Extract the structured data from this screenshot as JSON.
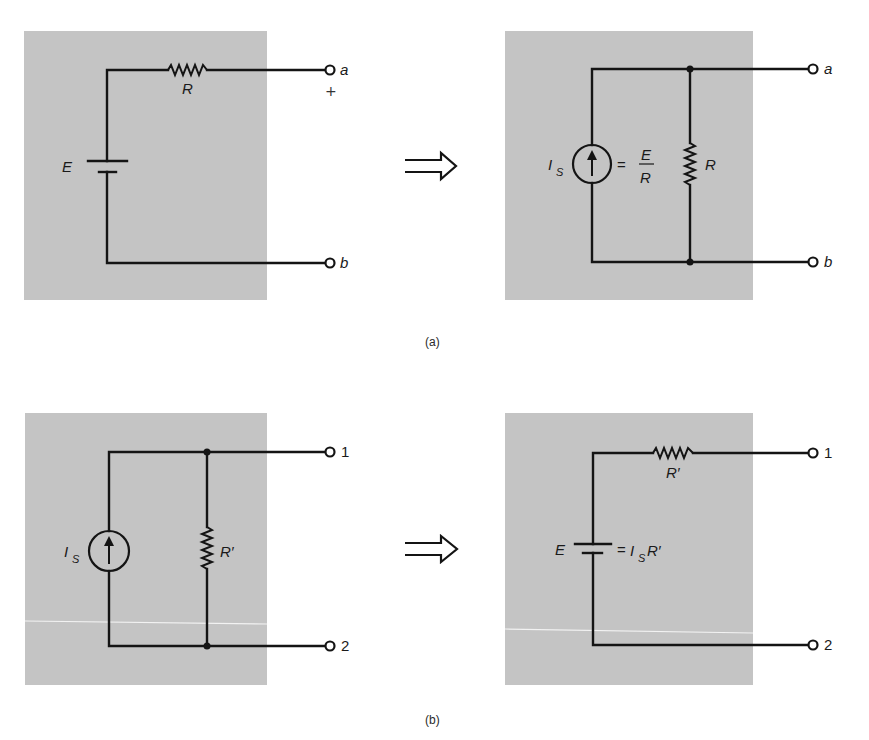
{
  "figure": {
    "colors": {
      "panel_gray": "#c4c4c4",
      "line": "#141414",
      "background": "#ffffff"
    },
    "part_a": {
      "caption": "(a)",
      "left_circuit": {
        "type": "voltage-source-series-resistor",
        "source_label": "E",
        "resistor_label": "R",
        "terminals": [
          {
            "label": "a",
            "polarity": "+"
          },
          {
            "label": "b"
          }
        ],
        "plus_sign": "+"
      },
      "transform_arrow": "⟹",
      "right_circuit": {
        "type": "current-source-parallel-resistor",
        "source_label_main": "I",
        "source_label_sub": "S",
        "equals": "=",
        "fraction_numerator": "E",
        "fraction_denominator": "R",
        "resistor_label": "R",
        "terminals": [
          {
            "label": "a"
          },
          {
            "label": "b"
          }
        ]
      }
    },
    "part_b": {
      "caption": "(b)",
      "left_circuit": {
        "type": "current-source-parallel-resistor",
        "source_label_main": "I",
        "source_label_sub": "S",
        "resistor_label": "R′",
        "terminals": [
          {
            "label": "1"
          },
          {
            "label": "2"
          }
        ]
      },
      "transform_arrow": "⟹",
      "right_circuit": {
        "type": "voltage-source-series-resistor",
        "source_label": "E",
        "equals": "=",
        "expr_main": "I",
        "expr_sub": "S",
        "expr_tail": "R′",
        "resistor_label": "R′",
        "terminals": [
          {
            "label": "1"
          },
          {
            "label": "2"
          }
        ]
      }
    }
  }
}
